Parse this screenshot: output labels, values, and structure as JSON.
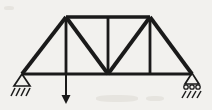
{
  "figure": {
    "name": "pin-roller-truss-with-point-load",
    "kind": "structural-engineering-diagram",
    "width": 212,
    "height": 110,
    "background_color": "#f2f1ee",
    "line_color": "#1a1a1a"
  },
  "geometry": {
    "bottom_chord_y": 74,
    "top_chord_y": 17,
    "left_support_x": 22,
    "right_support_x": 192,
    "left_top_node_x": 66,
    "center_node_x": 108,
    "right_top_node_x": 150
  },
  "nodes": [
    {
      "id": "A",
      "label": "left-pin-support-node",
      "x": 22,
      "y": 74
    },
    {
      "id": "B",
      "label": "bottom-left-panel-node",
      "x": 66,
      "y": 74
    },
    {
      "id": "C",
      "label": "bottom-center-node",
      "x": 108,
      "y": 74
    },
    {
      "id": "D",
      "label": "bottom-right-panel-node",
      "x": 150,
      "y": 74
    },
    {
      "id": "E",
      "label": "right-roller-support-node",
      "x": 192,
      "y": 74
    },
    {
      "id": "F",
      "label": "top-left-node",
      "x": 66,
      "y": 17
    },
    {
      "id": "G",
      "label": "top-center-node",
      "x": 108,
      "y": 17
    },
    {
      "id": "H",
      "label": "top-right-node",
      "x": 150,
      "y": 17
    }
  ],
  "members": [
    {
      "name": "bottom-chord-A-B",
      "x1": 22,
      "y1": 74,
      "x2": 66,
      "y2": 74,
      "width": 3
    },
    {
      "name": "bottom-chord-B-C",
      "x1": 66,
      "y1": 74,
      "x2": 108,
      "y2": 74,
      "width": 3
    },
    {
      "name": "bottom-chord-C-D",
      "x1": 108,
      "y1": 74,
      "x2": 150,
      "y2": 74,
      "width": 3
    },
    {
      "name": "bottom-chord-D-E",
      "x1": 150,
      "y1": 74,
      "x2": 192,
      "y2": 74,
      "width": 3
    },
    {
      "name": "top-chord-F-G",
      "x1": 66,
      "y1": 17,
      "x2": 108,
      "y2": 17,
      "width": 3.6
    },
    {
      "name": "top-chord-G-H",
      "x1": 108,
      "y1": 17,
      "x2": 150,
      "y2": 17,
      "width": 3.6
    },
    {
      "name": "end-post-left-A-F",
      "x1": 22,
      "y1": 74,
      "x2": 66,
      "y2": 17,
      "width": 3.8
    },
    {
      "name": "end-post-right-H-E",
      "x1": 150,
      "y1": 17,
      "x2": 192,
      "y2": 74,
      "width": 3.8
    },
    {
      "name": "diagonal-F-C",
      "x1": 66,
      "y1": 17,
      "x2": 108,
      "y2": 74,
      "width": 3.8
    },
    {
      "name": "diagonal-C-H",
      "x1": 108,
      "y1": 74,
      "x2": 150,
      "y2": 17,
      "width": 3.8
    },
    {
      "name": "vertical-B-F",
      "x1": 66,
      "y1": 17,
      "x2": 66,
      "y2": 74,
      "width": 2.8
    },
    {
      "name": "vertical-C-G",
      "x1": 108,
      "y1": 17,
      "x2": 108,
      "y2": 74,
      "width": 2.8
    },
    {
      "name": "vertical-D-H",
      "x1": 150,
      "y1": 17,
      "x2": 150,
      "y2": 74,
      "width": 2.8
    }
  ],
  "supports": {
    "left": {
      "type": "pin",
      "name": "pin-support",
      "apex_x": 22,
      "apex_y": 74,
      "half_width": 8,
      "height": 12,
      "hatch_y": 88,
      "hatch_marks": [
        {
          "x1": 11,
          "y1": 96,
          "x2": 15,
          "y2": 88
        },
        {
          "x1": 16,
          "y1": 96,
          "x2": 20,
          "y2": 88
        },
        {
          "x1": 21,
          "y1": 96,
          "x2": 25,
          "y2": 88
        },
        {
          "x1": 26,
          "y1": 96,
          "x2": 30,
          "y2": 88
        }
      ]
    },
    "right": {
      "type": "roller",
      "name": "roller-support",
      "apex_x": 192,
      "apex_y": 73,
      "half_width": 7,
      "height": 11,
      "rollers": [
        {
          "cx": 186,
          "cy": 87,
          "r": 2.2
        },
        {
          "cx": 192,
          "cy": 87,
          "r": 2.2
        },
        {
          "cx": 198,
          "cy": 87,
          "r": 2.2
        }
      ],
      "hatch_marks": [
        {
          "x1": 182,
          "y1": 98,
          "x2": 186,
          "y2": 91
        },
        {
          "x1": 187,
          "y1": 98,
          "x2": 191,
          "y2": 91
        },
        {
          "x1": 192,
          "y1": 98,
          "x2": 196,
          "y2": 91
        },
        {
          "x1": 197,
          "y1": 98,
          "x2": 201,
          "y2": 91
        }
      ]
    }
  },
  "load": {
    "name": "point-load-arrow",
    "direction": "down",
    "x": 66,
    "y_start": 75,
    "y_end": 104,
    "shaft_width": 2,
    "head_half_width": 4.5,
    "head_length": 9
  },
  "blots": [
    {
      "x": 96,
      "y": 95,
      "w": 42,
      "h": 7
    },
    {
      "x": 146,
      "y": 96,
      "w": 18,
      "h": 5
    },
    {
      "x": 4,
      "y": 6,
      "w": 10,
      "h": 4
    }
  ]
}
